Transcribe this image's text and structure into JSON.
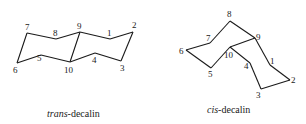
{
  "figure": {
    "diagrams": [
      {
        "id": "trans",
        "caption_italic": "trans",
        "caption_rest": "-decalin",
        "vertices": {
          "1": [
            110,
            39
          ],
          "2": [
            133,
            32
          ],
          "3": [
            121,
            61
          ],
          "4": [
            95,
            53
          ],
          "10": [
            70,
            62
          ],
          "5": [
            41,
            55
          ],
          "6": [
            17,
            63
          ],
          "7": [
            27,
            33
          ],
          "8": [
            56,
            39
          ],
          "9": [
            80,
            32
          ]
        },
        "bonds": [
          [
            "7",
            "8"
          ],
          [
            "8",
            "9"
          ],
          [
            "9",
            "1"
          ],
          [
            "1",
            "2"
          ],
          [
            "2",
            "3"
          ],
          [
            "3",
            "4"
          ],
          [
            "4",
            "10"
          ],
          [
            "10",
            "5"
          ],
          [
            "5",
            "6"
          ],
          [
            "6",
            "7"
          ],
          [
            "9",
            "10"
          ]
        ],
        "labels": [
          {
            "text": "1",
            "x": 107,
            "y": 36
          },
          {
            "text": "2",
            "x": 132,
            "y": 28
          },
          {
            "text": "3",
            "x": 120,
            "y": 71
          },
          {
            "text": "4",
            "x": 92,
            "y": 63
          },
          {
            "text": "5",
            "x": 37,
            "y": 61
          },
          {
            "text": "6",
            "x": 13,
            "y": 73
          },
          {
            "text": "7",
            "x": 25,
            "y": 30
          },
          {
            "text": "8",
            "x": 53,
            "y": 36
          },
          {
            "text": "9",
            "x": 77,
            "y": 29
          },
          {
            "text": "10",
            "x": 64,
            "y": 73
          }
        ]
      },
      {
        "id": "cis",
        "caption_italic": "cis",
        "caption_rest": "-decalin",
        "vertices": {
          "1": [
            270,
            65
          ],
          "2": [
            290,
            80
          ],
          "3": [
            261,
            89
          ],
          "4": [
            250,
            63
          ],
          "10": [
            230,
            47
          ],
          "5": [
            211,
            68
          ],
          "6": [
            186,
            50
          ],
          "7": [
            210,
            43
          ],
          "8": [
            230,
            21
          ],
          "9": [
            255,
            38
          ]
        },
        "bonds": [
          [
            "6",
            "7"
          ],
          [
            "7",
            "8"
          ],
          [
            "8",
            "9"
          ],
          [
            "9",
            "1"
          ],
          [
            "1",
            "2"
          ],
          [
            "2",
            "3"
          ],
          [
            "3",
            "4"
          ],
          [
            "4",
            "10"
          ],
          [
            "10",
            "9"
          ],
          [
            "10",
            "5"
          ],
          [
            "5",
            "6"
          ]
        ],
        "labels": [
          {
            "text": "1",
            "x": 270,
            "y": 64
          },
          {
            "text": "2",
            "x": 291,
            "y": 83
          },
          {
            "text": "3",
            "x": 256,
            "y": 98
          },
          {
            "text": "4",
            "x": 244,
            "y": 69
          },
          {
            "text": "5",
            "x": 208,
            "y": 77
          },
          {
            "text": "6",
            "x": 179,
            "y": 54
          },
          {
            "text": "7",
            "x": 206,
            "y": 41
          },
          {
            "text": "8",
            "x": 227,
            "y": 17
          },
          {
            "text": "9",
            "x": 256,
            "y": 40
          },
          {
            "text": "10",
            "x": 224,
            "y": 58
          }
        ]
      }
    ]
  }
}
